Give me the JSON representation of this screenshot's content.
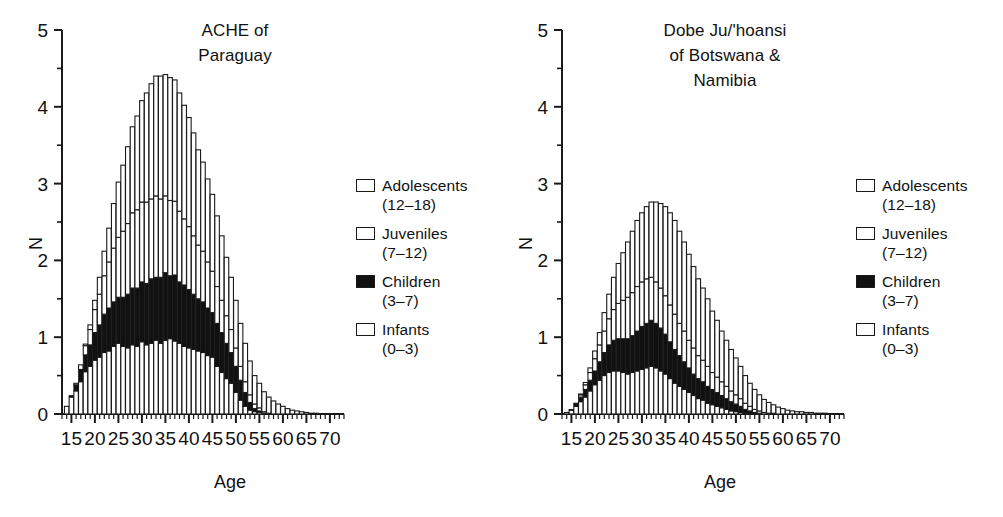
{
  "figure": {
    "background": "#ffffff",
    "ink_color": "#1a1a1a",
    "fill_dark": "#111111",
    "fill_light": "#ffffff"
  },
  "panels": [
    {
      "id": "ache-paraguay",
      "title": "ACHE of\nParaguay",
      "xlabel": "Age",
      "ylabel": "N"
    },
    {
      "id": "dobe-juhoansi",
      "title": "Dobe Ju/'hoansi\nof Botswana &\nNamibia",
      "xlabel": "Age",
      "ylabel": "N"
    }
  ],
  "legend": {
    "items": [
      {
        "label": "Adolescents",
        "range": "(12–18)",
        "swatch": "open"
      },
      {
        "label": "Juveniles",
        "range": "(7–12)",
        "swatch": "open"
      },
      {
        "label": "Children",
        "range": "(3–7)",
        "swatch": "filled"
      },
      {
        "label": "Infants",
        "range": "(0–3)",
        "swatch": "open"
      }
    ]
  },
  "axis": {
    "y_ticks": [
      "0",
      "1",
      "2",
      "3",
      "4",
      "5"
    ],
    "y_minor_step": 0.5,
    "x_ticks": [
      "15",
      "20",
      "25",
      "30",
      "35",
      "40",
      "45",
      "50",
      "55",
      "60",
      "65",
      "70"
    ],
    "x_minor_step": 1
  },
  "chart_data": [
    {
      "type": "bar",
      "stacked": true,
      "title": "ACHE of Paraguay",
      "xlabel": "Age",
      "ylabel": "N",
      "xlim": [
        13,
        73
      ],
      "ylim": [
        0,
        5
      ],
      "grid": false,
      "legend_position": "right-inside",
      "x": [
        14,
        15,
        16,
        17,
        18,
        19,
        20,
        21,
        22,
        23,
        24,
        25,
        26,
        27,
        28,
        29,
        30,
        31,
        32,
        33,
        34,
        35,
        36,
        37,
        38,
        39,
        40,
        41,
        42,
        43,
        44,
        45,
        46,
        47,
        48,
        49,
        50,
        51,
        52,
        53,
        54,
        55,
        56,
        57,
        58,
        59,
        60,
        61,
        62,
        63,
        64,
        65,
        66,
        67,
        68
      ],
      "series": [
        {
          "name": "Infants (0-3)",
          "fill": "#ffffff",
          "values": [
            0.1,
            0.22,
            0.3,
            0.42,
            0.55,
            0.62,
            0.7,
            0.74,
            0.8,
            0.82,
            0.88,
            0.92,
            0.88,
            0.86,
            0.9,
            0.88,
            0.94,
            0.9,
            0.92,
            0.96,
            0.92,
            0.96,
            0.98,
            0.95,
            0.92,
            0.88,
            0.86,
            0.84,
            0.82,
            0.8,
            0.76,
            0.74,
            0.62,
            0.54,
            0.46,
            0.4,
            0.28,
            0.18,
            0.1,
            0.05,
            0.03,
            0.02,
            0.01,
            0.0,
            0.0,
            0.0,
            0.0,
            0.0,
            0.0,
            0.0,
            0.0,
            0.0,
            0.0,
            0.0,
            0.0
          ]
        },
        {
          "name": "Children (3-7)",
          "fill": "#111111",
          "values": [
            0.0,
            0.02,
            0.08,
            0.16,
            0.22,
            0.28,
            0.36,
            0.42,
            0.5,
            0.56,
            0.58,
            0.6,
            0.64,
            0.7,
            0.74,
            0.76,
            0.78,
            0.8,
            0.84,
            0.82,
            0.86,
            0.88,
            0.82,
            0.86,
            0.8,
            0.8,
            0.76,
            0.72,
            0.68,
            0.66,
            0.62,
            0.58,
            0.56,
            0.52,
            0.46,
            0.4,
            0.34,
            0.26,
            0.18,
            0.1,
            0.04,
            0.02,
            0.0,
            0.0,
            0.0,
            0.0,
            0.0,
            0.0,
            0.0,
            0.0,
            0.0,
            0.0,
            0.0,
            0.0,
            0.0
          ]
        },
        {
          "name": "Juveniles (7-12)",
          "fill": "#ffffff",
          "values": [
            0.0,
            0.0,
            0.02,
            0.06,
            0.12,
            0.2,
            0.3,
            0.4,
            0.5,
            0.6,
            0.7,
            0.78,
            0.86,
            0.92,
            0.98,
            1.02,
            1.04,
            1.06,
            1.04,
            1.06,
            1.02,
            1.0,
            0.98,
            0.96,
            0.92,
            0.86,
            0.82,
            0.76,
            0.7,
            0.66,
            0.6,
            0.54,
            0.48,
            0.42,
            0.36,
            0.3,
            0.24,
            0.18,
            0.14,
            0.1,
            0.06,
            0.04,
            0.02,
            0.01,
            0.0,
            0.0,
            0.0,
            0.0,
            0.0,
            0.0,
            0.0,
            0.0,
            0.0,
            0.0,
            0.0
          ]
        },
        {
          "name": "Adolescents (12-18)",
          "fill": "#ffffff",
          "values": [
            0.0,
            0.0,
            0.0,
            0.0,
            0.02,
            0.06,
            0.12,
            0.22,
            0.32,
            0.44,
            0.58,
            0.72,
            0.86,
            1.0,
            1.12,
            1.22,
            1.32,
            1.42,
            1.5,
            1.56,
            1.6,
            1.58,
            1.6,
            1.58,
            1.54,
            1.48,
            1.42,
            1.34,
            1.24,
            1.16,
            1.08,
            1.0,
            0.92,
            0.84,
            0.76,
            0.68,
            0.62,
            0.56,
            0.5,
            0.44,
            0.37,
            0.32,
            0.26,
            0.21,
            0.17,
            0.13,
            0.1,
            0.07,
            0.05,
            0.04,
            0.03,
            0.02,
            0.01,
            0.01,
            0.0
          ]
        }
      ],
      "stack_totals": [
        0.1,
        0.24,
        0.4,
        0.64,
        0.91,
        1.16,
        1.48,
        1.78,
        2.12,
        2.42,
        2.74,
        3.02,
        3.24,
        3.48,
        3.74,
        3.88,
        4.08,
        4.18,
        4.3,
        4.4,
        4.4,
        4.42,
        4.38,
        4.35,
        4.18,
        4.02,
        3.86,
        3.66,
        3.44,
        3.28,
        3.06,
        2.86,
        2.58,
        2.32,
        2.04,
        1.78,
        1.48,
        1.18,
        0.92,
        0.69,
        0.5,
        0.4,
        0.29,
        0.22,
        0.17,
        0.13,
        0.1,
        0.07,
        0.05,
        0.04,
        0.03,
        0.02,
        0.01,
        0.01,
        0.0
      ]
    },
    {
      "type": "bar",
      "stacked": true,
      "title": "Dobe Ju/'hoansi of Botswana & Namibia",
      "xlabel": "Age",
      "ylabel": "N",
      "xlim": [
        13,
        73
      ],
      "ylim": [
        0,
        5
      ],
      "grid": false,
      "legend_position": "right-inside",
      "x": [
        14,
        15,
        16,
        17,
        18,
        19,
        20,
        21,
        22,
        23,
        24,
        25,
        26,
        27,
        28,
        29,
        30,
        31,
        32,
        33,
        34,
        35,
        36,
        37,
        38,
        39,
        40,
        41,
        42,
        43,
        44,
        45,
        46,
        47,
        48,
        49,
        50,
        51,
        52,
        53,
        54,
        55,
        56,
        57,
        58,
        59,
        60,
        61,
        62,
        63,
        64,
        65,
        66,
        67,
        68,
        69,
        70
      ],
      "series": [
        {
          "name": "Infants (0-3)",
          "fill": "#ffffff",
          "values": [
            0.02,
            0.05,
            0.1,
            0.16,
            0.22,
            0.3,
            0.38,
            0.44,
            0.5,
            0.54,
            0.56,
            0.56,
            0.54,
            0.52,
            0.54,
            0.56,
            0.58,
            0.6,
            0.62,
            0.6,
            0.56,
            0.52,
            0.46,
            0.4,
            0.36,
            0.32,
            0.28,
            0.24,
            0.2,
            0.18,
            0.14,
            0.12,
            0.1,
            0.08,
            0.06,
            0.04,
            0.03,
            0.02,
            0.01,
            0.01,
            0.0,
            0.0,
            0.0,
            0.0,
            0.0,
            0.0,
            0.0,
            0.0,
            0.0,
            0.0,
            0.0,
            0.0,
            0.0,
            0.0,
            0.0,
            0.0,
            0.0
          ]
        },
        {
          "name": "Children (3-7)",
          "fill": "#111111",
          "values": [
            0.0,
            0.01,
            0.03,
            0.06,
            0.1,
            0.14,
            0.18,
            0.24,
            0.3,
            0.36,
            0.4,
            0.42,
            0.44,
            0.46,
            0.48,
            0.52,
            0.56,
            0.58,
            0.6,
            0.58,
            0.56,
            0.52,
            0.48,
            0.44,
            0.4,
            0.36,
            0.32,
            0.28,
            0.26,
            0.24,
            0.22,
            0.2,
            0.18,
            0.16,
            0.14,
            0.12,
            0.1,
            0.08,
            0.05,
            0.03,
            0.02,
            0.01,
            0.0,
            0.0,
            0.0,
            0.0,
            0.0,
            0.0,
            0.0,
            0.0,
            0.0,
            0.0,
            0.0,
            0.0,
            0.0,
            0.0,
            0.0
          ]
        },
        {
          "name": "Juveniles (7-12)",
          "fill": "#ffffff",
          "values": [
            0.0,
            0.0,
            0.01,
            0.03,
            0.06,
            0.1,
            0.16,
            0.22,
            0.28,
            0.34,
            0.4,
            0.46,
            0.5,
            0.54,
            0.56,
            0.58,
            0.58,
            0.58,
            0.56,
            0.54,
            0.52,
            0.5,
            0.48,
            0.46,
            0.42,
            0.4,
            0.36,
            0.34,
            0.3,
            0.28,
            0.26,
            0.22,
            0.2,
            0.18,
            0.16,
            0.14,
            0.12,
            0.1,
            0.08,
            0.06,
            0.04,
            0.03,
            0.02,
            0.01,
            0.01,
            0.0,
            0.0,
            0.0,
            0.0,
            0.0,
            0.0,
            0.0,
            0.0,
            0.0,
            0.0,
            0.0,
            0.0
          ]
        },
        {
          "name": "Adolescents (12-18)",
          "fill": "#ffffff",
          "values": [
            0.0,
            0.0,
            0.0,
            0.01,
            0.03,
            0.06,
            0.1,
            0.16,
            0.24,
            0.32,
            0.42,
            0.52,
            0.62,
            0.72,
            0.8,
            0.86,
            0.9,
            0.94,
            0.98,
            1.04,
            1.1,
            1.16,
            1.2,
            1.22,
            1.2,
            1.16,
            1.12,
            1.06,
            1.0,
            0.94,
            0.88,
            0.8,
            0.74,
            0.66,
            0.6,
            0.54,
            0.48,
            0.42,
            0.36,
            0.3,
            0.26,
            0.21,
            0.17,
            0.14,
            0.11,
            0.09,
            0.07,
            0.05,
            0.04,
            0.03,
            0.03,
            0.02,
            0.02,
            0.01,
            0.01,
            0.01,
            0.0
          ]
        },
        {
          "name": "TOTAL_HINT",
          "hidden": true,
          "values": []
        }
      ],
      "stack_totals": [
        0.02,
        0.06,
        0.14,
        0.26,
        0.41,
        0.6,
        0.82,
        1.06,
        1.32,
        1.56,
        1.78,
        1.96,
        2.08,
        2.24,
        2.38,
        2.52,
        2.62,
        2.7,
        2.76,
        2.76,
        2.74,
        2.7,
        2.62,
        2.52,
        2.38,
        2.24,
        2.08,
        1.92,
        1.76,
        1.64,
        1.5,
        1.34,
        1.22,
        1.08,
        0.96,
        0.84,
        0.73,
        0.62,
        0.5,
        0.4,
        0.32,
        0.25,
        0.19,
        0.15,
        0.12,
        0.09,
        0.07,
        0.05,
        0.04,
        0.03,
        0.03,
        0.02,
        0.02,
        0.01,
        0.01,
        0.01,
        0.0
      ]
    }
  ]
}
